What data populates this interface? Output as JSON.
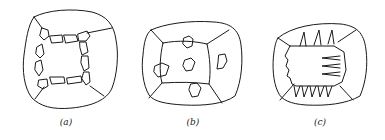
{
  "figure": {
    "panels": [
      {
        "id": "a",
        "label": "(a)",
        "description": "Grain with boundary ring of small segmented grains surrounding a central region"
      },
      {
        "id": "b",
        "label": "(b)",
        "description": "Grain divided by boundaries with isolated irregular particles"
      },
      {
        "id": "c",
        "label": "(c)",
        "description": "Grain with dendritic/needle-like spikes growing from a central block"
      }
    ],
    "colors": {
      "line": "#1a1a1a",
      "background": "#ffffff"
    }
  }
}
